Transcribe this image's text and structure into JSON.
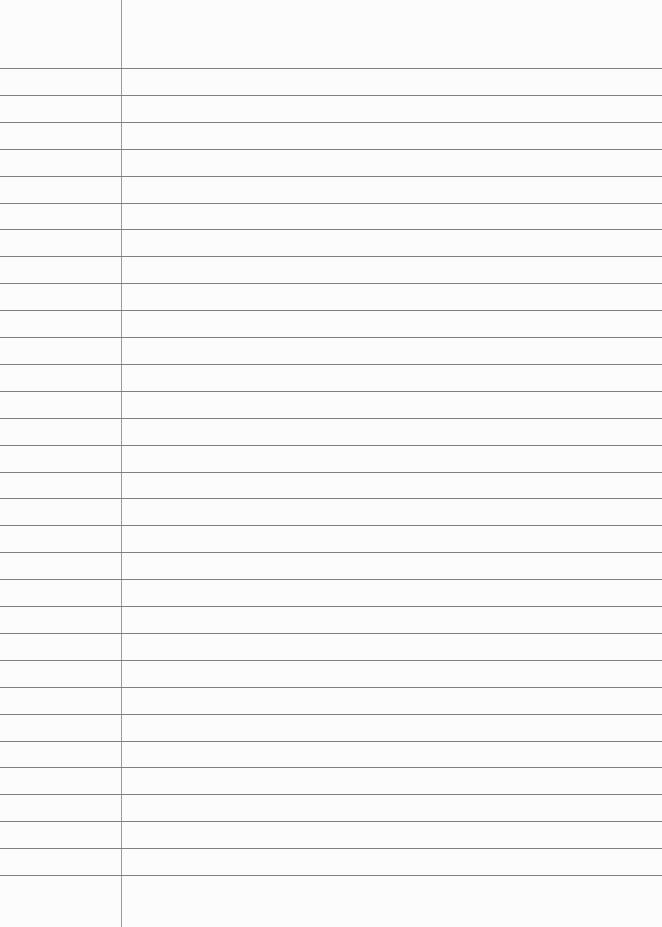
{
  "paper": {
    "type": "lined-notebook-page",
    "background_color": "#fcfcfc",
    "rule_color": "#7f7f7f",
    "margin_line_color": "#9a9a9a",
    "margin_x": 121,
    "first_rule_y": 68,
    "rule_spacing": 26.9,
    "rule_count": 31
  }
}
